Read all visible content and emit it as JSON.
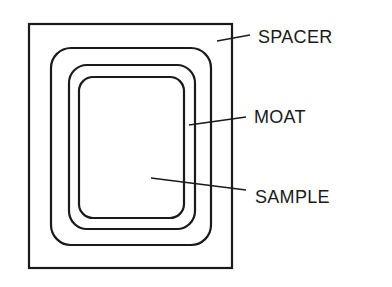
{
  "diagram": {
    "type": "schematic",
    "labels": {
      "spacer": "SPACER",
      "moat": "MOAT",
      "sample": "SAMPLE"
    },
    "colors": {
      "stroke": "#1a1a1a",
      "background": "#ffffff"
    }
  }
}
